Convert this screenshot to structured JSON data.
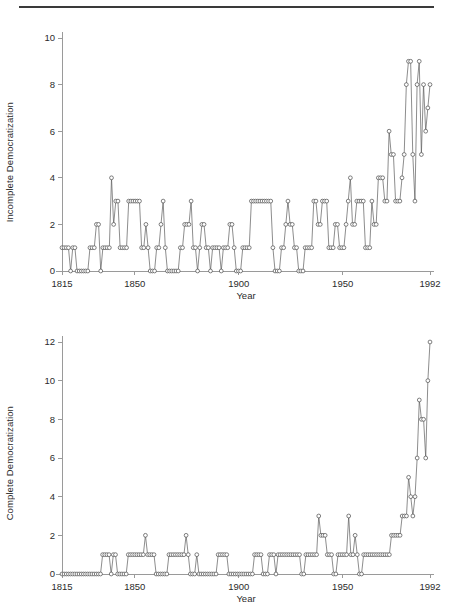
{
  "page": {
    "has_top_rule": true,
    "background_color": "#ffffff",
    "line_color": "#5b5b5b",
    "marker_fill": "#ffffff",
    "axis_color": "#9a9a9a"
  },
  "chart_data": [
    {
      "id": "incomplete",
      "type": "line",
      "title": "",
      "xlabel": "Year",
      "ylabel": "Incomplete Democratization",
      "xlim": [
        1815,
        1992
      ],
      "ylim": [
        0,
        10
      ],
      "xticks": [
        1815,
        1850,
        1900,
        1950,
        1992
      ],
      "xtick_labels": [
        "1815",
        "1850",
        "1900",
        "1950",
        "1992"
      ],
      "yticks": [
        0,
        2,
        4,
        6,
        8,
        10
      ],
      "ytick_labels": [
        "0",
        "2",
        "4",
        "6",
        "8",
        "10"
      ],
      "grid": false,
      "legend": "none",
      "marker": "open-circle",
      "x_start": 1815,
      "values": [
        1,
        1,
        1,
        1,
        0,
        1,
        1,
        0,
        0,
        0,
        0,
        0,
        0,
        1,
        1,
        1,
        2,
        2,
        0,
        1,
        1,
        1,
        1,
        4,
        2,
        3,
        3,
        1,
        1,
        1,
        1,
        3,
        3,
        3,
        3,
        3,
        3,
        1,
        1,
        2,
        1,
        0,
        0,
        0,
        1,
        1,
        2,
        3,
        1,
        0,
        0,
        0,
        0,
        0,
        0,
        1,
        1,
        2,
        2,
        2,
        3,
        1,
        1,
        0,
        1,
        2,
        2,
        1,
        1,
        0,
        1,
        1,
        1,
        1,
        0,
        1,
        1,
        1,
        2,
        2,
        1,
        0,
        0,
        0,
        1,
        1,
        1,
        1,
        3,
        3,
        3,
        3,
        3,
        3,
        3,
        3,
        3,
        3,
        1,
        0,
        0,
        0,
        1,
        1,
        2,
        3,
        2,
        2,
        1,
        1,
        0,
        0,
        0,
        1,
        1,
        1,
        1,
        3,
        3,
        2,
        2,
        3,
        3,
        3,
        1,
        1,
        1,
        2,
        2,
        1,
        1,
        1,
        2,
        3,
        4,
        2,
        2,
        3,
        3,
        3,
        3,
        1,
        1,
        1,
        3,
        2,
        2,
        4,
        4,
        4,
        3,
        3,
        6,
        5,
        5,
        3,
        3,
        3,
        4,
        5,
        8,
        9,
        9,
        5,
        3,
        8,
        9,
        5,
        8,
        6,
        7,
        8
      ]
    },
    {
      "id": "complete",
      "type": "line",
      "title": "",
      "xlabel": "Year",
      "ylabel": "Complete Democratization",
      "xlim": [
        1815,
        1992
      ],
      "ylim": [
        0,
        12
      ],
      "xticks": [
        1815,
        1850,
        1900,
        1950,
        1992
      ],
      "xtick_labels": [
        "1815",
        "1850",
        "1900",
        "1950",
        "1992"
      ],
      "yticks": [
        0,
        2,
        4,
        6,
        8,
        10,
        12
      ],
      "ytick_labels": [
        "0",
        "2",
        "4",
        "6",
        "8",
        "10",
        "12"
      ],
      "grid": false,
      "legend": "none",
      "marker": "open-circle",
      "x_start": 1815,
      "values": [
        0,
        0,
        0,
        0,
        0,
        0,
        0,
        0,
        0,
        0,
        0,
        0,
        0,
        0,
        0,
        0,
        0,
        0,
        0,
        1,
        1,
        1,
        1,
        0,
        1,
        1,
        0,
        0,
        0,
        0,
        0,
        1,
        1,
        1,
        1,
        1,
        1,
        1,
        1,
        2,
        1,
        1,
        1,
        1,
        0,
        0,
        0,
        0,
        0,
        0,
        1,
        1,
        1,
        1,
        1,
        1,
        1,
        1,
        2,
        1,
        0,
        0,
        0,
        1,
        0,
        0,
        0,
        0,
        0,
        0,
        0,
        0,
        0,
        1,
        1,
        1,
        1,
        1,
        0,
        0,
        0,
        0,
        0,
        0,
        0,
        0,
        0,
        0,
        0,
        0,
        1,
        1,
        1,
        1,
        0,
        0,
        0,
        1,
        1,
        1,
        0,
        1,
        1,
        1,
        1,
        1,
        1,
        1,
        1,
        1,
        1,
        1,
        0,
        0,
        1,
        1,
        1,
        1,
        1,
        1,
        3,
        2,
        2,
        2,
        1,
        1,
        1,
        0,
        0,
        1,
        1,
        1,
        1,
        1,
        3,
        1,
        1,
        2,
        1,
        0,
        0,
        1,
        1,
        1,
        1,
        1,
        1,
        1,
        1,
        1,
        1,
        1,
        1,
        1,
        2,
        2,
        2,
        2,
        2,
        3,
        3,
        3,
        5,
        4,
        3,
        4,
        6,
        9,
        8,
        8,
        6,
        10,
        12
      ]
    }
  ]
}
